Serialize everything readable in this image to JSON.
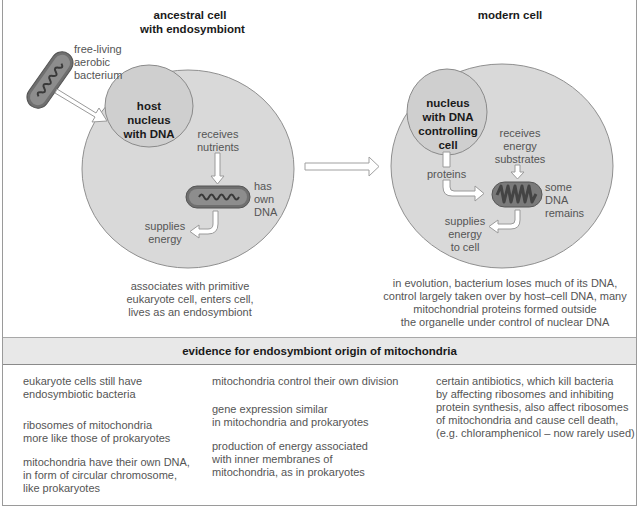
{
  "colors": {
    "cell_fill": "#d9d9d9",
    "cell_stroke": "#8f8f8f",
    "nucleus_fill": "#cfcfcf",
    "bacterium_outer": "#6f6f6f",
    "bacterium_inner": "#8d8d8d",
    "band_fill": "#e8e8e8"
  },
  "ancestral": {
    "title": "ancestral cell\nwith endosymbiont",
    "free_bacterium_label": "free-living\naerobic\nbacterium",
    "nucleus_label": "host\nnucleus\nwith DNA",
    "receives_label": "receives\nnutrients",
    "has_dna_label": "has\nown\nDNA",
    "supplies_label": "supplies\nenergy",
    "caption": "associates with primitive\neukaryote cell, enters cell,\nlives as an endosymbiont"
  },
  "modern": {
    "title": "modern cell",
    "nucleus_label": "nucleus\nwith DNA\ncontrolling\ncell",
    "receives_label": "receives\nenergy\nsubstrates",
    "proteins_label": "proteins",
    "dna_remains_label": "some\nDNA\nremains",
    "supplies_label": "supplies\nenergy\nto cell",
    "caption": "in evolution, bacterium loses much of its DNA,\ncontrol largely taken over by host–cell DNA, many\nmitochondrial proteins formed outside\nthe organelle under control of nuclear DNA"
  },
  "evidence": {
    "title": "evidence for endosymbiont origin of mitochondria",
    "columns": [
      [
        "eukaryote cells still have\nendosymbiotic bacteria",
        "ribosomes of mitochondria\nmore like those of prokaryotes",
        "mitochondria have their own DNA,\nin form of circular chromosome,\nlike prokaryotes"
      ],
      [
        "mitochondria control their own division",
        "gene expression similar\nin mitochondria and prokaryotes",
        "production of energy associated\nwith inner membranes of\nmitochondria, as in prokaryotes"
      ],
      [
        "certain antibiotics, which kill bacteria\nby affecting ribosomes and inhibiting\nprotein synthesis, also affect ribosomes\nof mitochondria and cause cell death,\n(e.g. chloramphenicol – now rarely used)"
      ]
    ]
  }
}
